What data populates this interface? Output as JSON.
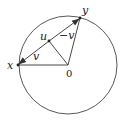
{
  "figure": {
    "colors": {
      "stroke": "#333333",
      "background": "#ffffff"
    },
    "circle": {
      "cx": 68,
      "cy": 65,
      "r": 49
    },
    "points": {
      "O": {
        "label": "0",
        "x": 68,
        "y": 65
      },
      "x": {
        "label": "x",
        "x": 18,
        "y": 65
      },
      "y": {
        "label": "y",
        "x": 80,
        "y": 18
      },
      "u": {
        "label": "u",
        "x": 49,
        "y": 41
      }
    },
    "vector_labels": {
      "v": "v",
      "minus_v": "−v"
    }
  }
}
